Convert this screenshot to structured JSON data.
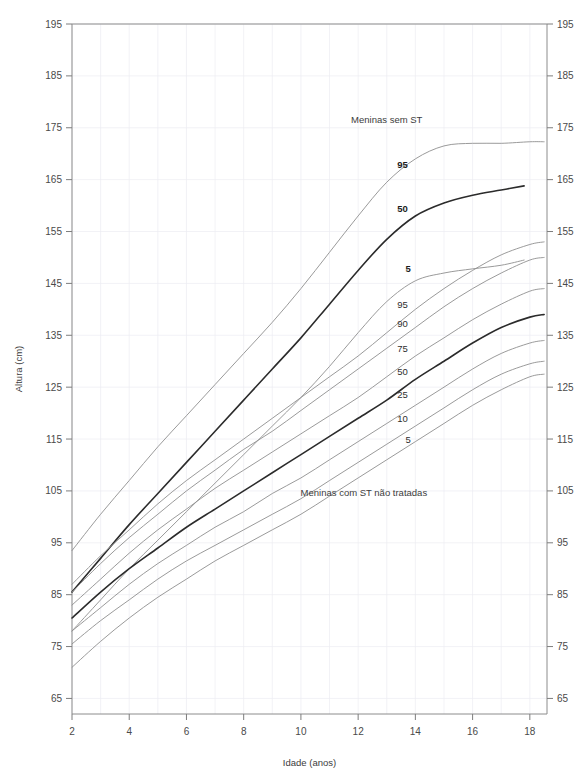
{
  "chart_data": {
    "type": "line",
    "title": "",
    "xlabel": "Idade (anos)",
    "ylabel": "Altura  (cm)",
    "xlim": [
      2,
      18.6
    ],
    "ylim": [
      62,
      195
    ],
    "grid": true,
    "x_ticks": [
      2,
      4,
      6,
      8,
      10,
      12,
      14,
      16,
      18
    ],
    "x_tick_labels": [
      "2",
      "4",
      "6",
      "8",
      "10",
      "12",
      "14",
      "16",
      "18"
    ],
    "x_minor_ticks": [
      3,
      5,
      7,
      9,
      11,
      13,
      15,
      17
    ],
    "y_ticks": [
      65,
      75,
      85,
      95,
      105,
      115,
      125,
      135,
      145,
      155,
      165,
      175,
      185,
      195
    ],
    "y_tick_labels": [
      "65",
      "75",
      "85",
      "95",
      "105",
      "115",
      "125",
      "135",
      "145",
      "155",
      "165",
      "175",
      "185",
      "195"
    ],
    "left_axis_labels": [
      "195",
      "185",
      "175",
      "165",
      "155",
      "145",
      "135",
      "125",
      "115",
      "105",
      "95",
      "85",
      "75",
      "65"
    ],
    "right_axis_labels": [
      "195",
      "185",
      "175",
      "165",
      "155",
      "145",
      "135",
      "125",
      "115",
      "105",
      "95",
      "85",
      "75",
      "65"
    ],
    "annotations": [
      {
        "text": "Meninas sem ST",
        "x": 13.0,
        "y": 176.0,
        "name": "annotation-girls-without-ts"
      },
      {
        "text": "Meninas com ST não tratadas",
        "x": 12.2,
        "y": 104.0,
        "name": "annotation-girls-with-untreated-ts"
      }
    ],
    "group_labels": [
      {
        "text": "95",
        "x": 13.55,
        "y": 168.0,
        "bold": true,
        "group": "sem_ST",
        "name": "label-sem-st-p95"
      },
      {
        "text": "50",
        "x": 13.55,
        "y": 159.5,
        "bold": true,
        "group": "sem_ST",
        "name": "label-sem-st-p50"
      },
      {
        "text": "5",
        "x": 13.75,
        "y": 147.8,
        "bold": true,
        "group": "sem_ST",
        "name": "label-sem-st-p5"
      },
      {
        "text": "95",
        "x": 13.55,
        "y": 141.0,
        "bold": false,
        "group": "com_ST",
        "name": "label-com-st-p95"
      },
      {
        "text": "90",
        "x": 13.55,
        "y": 137.2,
        "bold": false,
        "group": "com_ST",
        "name": "label-com-st-p90"
      },
      {
        "text": "75",
        "x": 13.55,
        "y": 132.5,
        "bold": false,
        "group": "com_ST",
        "name": "label-com-st-p75"
      },
      {
        "text": "50",
        "x": 13.55,
        "y": 128.0,
        "bold": false,
        "group": "com_ST",
        "name": "label-com-st-p50"
      },
      {
        "text": "25",
        "x": 13.55,
        "y": 123.5,
        "bold": false,
        "group": "com_ST",
        "name": "label-com-st-p25"
      },
      {
        "text": "10",
        "x": 13.55,
        "y": 119.0,
        "bold": false,
        "group": "com_ST",
        "name": "label-com-st-p10"
      },
      {
        "text": "5",
        "x": 13.75,
        "y": 115.0,
        "bold": false,
        "group": "com_ST",
        "name": "label-com-st-p5"
      }
    ],
    "series": [
      {
        "name": "Meninas sem ST — 95",
        "group": "sem_ST",
        "percentile": 95,
        "style": "thin",
        "x": [
          2,
          3,
          4,
          5,
          6,
          7,
          8,
          9,
          10,
          11,
          12,
          13,
          14,
          15,
          16,
          17,
          18,
          18.5
        ],
        "values": [
          93.5,
          100.5,
          107.0,
          113.5,
          119.5,
          125.5,
          131.5,
          137.5,
          144.0,
          151.0,
          158.0,
          164.5,
          169.0,
          171.5,
          172.0,
          172.0,
          172.3,
          172.3
        ]
      },
      {
        "name": "Meninas sem ST — 50",
        "group": "sem_ST",
        "percentile": 50,
        "style": "bold",
        "x": [
          2,
          3,
          4,
          5,
          6,
          7,
          8,
          9,
          10,
          11,
          12,
          13,
          14,
          15,
          16,
          17,
          17.8
        ],
        "values": [
          85.5,
          92.0,
          98.5,
          104.5,
          110.5,
          116.5,
          122.5,
          128.5,
          134.5,
          141.0,
          147.5,
          153.5,
          158.0,
          160.5,
          162.0,
          163.0,
          163.8
        ]
      },
      {
        "name": "Meninas sem ST — 5",
        "group": "sem_ST",
        "percentile": 5,
        "style": "thin",
        "x": [
          2,
          3,
          4,
          5,
          6,
          7,
          8,
          9,
          10,
          11,
          12,
          13,
          14,
          15,
          16,
          17,
          17.8
        ],
        "values": [
          78.0,
          84.0,
          90.0,
          95.5,
          101.0,
          106.5,
          112.0,
          117.5,
          123.0,
          129.0,
          135.5,
          141.5,
          145.5,
          147.0,
          147.8,
          148.5,
          149.5
        ]
      },
      {
        "name": "Meninas com ST — 95",
        "group": "com_ST",
        "percentile": 95,
        "style": "thin",
        "x": [
          2,
          3,
          4,
          5,
          6,
          7,
          8,
          9,
          10,
          11,
          12,
          13,
          14,
          15,
          16,
          17,
          18,
          18.5
        ],
        "values": [
          87.0,
          92.5,
          97.5,
          102.5,
          107.0,
          111.0,
          115.0,
          119.0,
          123.0,
          127.0,
          131.0,
          135.5,
          140.0,
          144.0,
          147.5,
          150.5,
          152.5,
          153.0
        ]
      },
      {
        "name": "Meninas com ST — 90",
        "group": "com_ST",
        "percentile": 90,
        "style": "thin",
        "x": [
          2,
          3,
          4,
          5,
          6,
          7,
          8,
          9,
          10,
          11,
          12,
          13,
          14,
          15,
          16,
          17,
          18,
          18.5
        ],
        "values": [
          85.5,
          91.0,
          96.0,
          100.5,
          105.0,
          109.0,
          113.0,
          116.5,
          120.5,
          124.5,
          128.5,
          132.5,
          136.5,
          140.5,
          144.0,
          147.0,
          149.5,
          150.0
        ]
      },
      {
        "name": "Meninas com ST — 75",
        "group": "com_ST",
        "percentile": 75,
        "style": "thin",
        "x": [
          2,
          3,
          4,
          5,
          6,
          7,
          8,
          9,
          10,
          11,
          12,
          13,
          14,
          15,
          16,
          17,
          18,
          18.5
        ],
        "values": [
          83.0,
          88.0,
          93.0,
          97.5,
          101.5,
          105.5,
          109.0,
          112.5,
          116.0,
          119.5,
          123.0,
          127.0,
          131.0,
          134.5,
          138.0,
          141.0,
          143.5,
          144.0
        ]
      },
      {
        "name": "Meninas com ST — 50",
        "group": "com_ST",
        "percentile": 50,
        "style": "bold",
        "x": [
          2,
          3,
          4,
          5,
          6,
          7,
          8,
          9,
          10,
          11,
          12,
          13,
          14,
          15,
          16,
          17,
          18,
          18.5
        ],
        "values": [
          80.5,
          85.5,
          90.0,
          94.0,
          98.0,
          101.5,
          105.0,
          108.5,
          112.0,
          115.5,
          119.0,
          122.5,
          126.5,
          130.0,
          133.5,
          136.5,
          138.5,
          139.0
        ]
      },
      {
        "name": "Meninas com ST — 25",
        "group": "com_ST",
        "percentile": 25,
        "style": "thin",
        "x": [
          2,
          3,
          4,
          5,
          6,
          7,
          8,
          9,
          10,
          11,
          12,
          13,
          14,
          15,
          16,
          17,
          18,
          18.5
        ],
        "values": [
          78.0,
          82.5,
          87.0,
          91.0,
          94.5,
          98.0,
          101.0,
          104.5,
          107.5,
          111.0,
          114.5,
          118.0,
          121.5,
          125.0,
          128.5,
          131.5,
          133.5,
          134.0
        ]
      },
      {
        "name": "Meninas com ST — 10",
        "group": "com_ST",
        "percentile": 10,
        "style": "thin",
        "x": [
          2,
          3,
          4,
          5,
          6,
          7,
          8,
          9,
          10,
          11,
          12,
          13,
          14,
          15,
          16,
          17,
          18,
          18.5
        ],
        "values": [
          75.5,
          80.0,
          84.0,
          88.0,
          91.5,
          94.5,
          97.5,
          100.5,
          103.5,
          107.0,
          110.5,
          114.0,
          117.5,
          121.0,
          124.5,
          127.5,
          129.5,
          130.0
        ]
      },
      {
        "name": "Meninas com ST — 5",
        "group": "com_ST",
        "percentile": 5,
        "style": "thin",
        "x": [
          2,
          3,
          4,
          5,
          6,
          7,
          8,
          9,
          10,
          11,
          12,
          13,
          14,
          15,
          16,
          17,
          18,
          18.5
        ],
        "values": [
          71.0,
          76.0,
          80.5,
          84.5,
          88.0,
          91.5,
          94.5,
          97.5,
          100.5,
          104.0,
          107.5,
          111.0,
          114.5,
          118.0,
          121.5,
          124.5,
          127.0,
          127.5
        ]
      }
    ]
  }
}
